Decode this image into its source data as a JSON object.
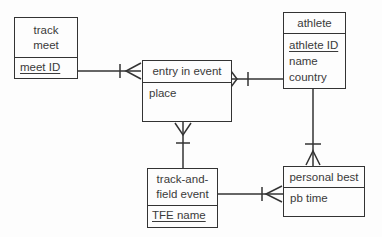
{
  "diagram": {
    "kind": "entity-relationship-diagram",
    "notation": "crows-foot",
    "colors": {
      "line": "#333333",
      "text": "#3a3a3a",
      "background": "#fdfdfd"
    },
    "entities": [
      {
        "id": "track-meet",
        "name": "track meet",
        "attributes": [
          {
            "label": "meet ID",
            "underlined": true
          }
        ]
      },
      {
        "id": "entry-in-event",
        "name": "entry in event",
        "attributes": [
          {
            "label": "place",
            "underlined": false
          }
        ]
      },
      {
        "id": "athlete",
        "name": "athlete",
        "attributes": [
          {
            "label": "athlete ID",
            "underlined": true
          },
          {
            "label": "name",
            "underlined": false
          },
          {
            "label": "country",
            "underlined": false
          }
        ]
      },
      {
        "id": "track-and-field-event",
        "name": "track-and-field event",
        "attributes": [
          {
            "label": "TFE name",
            "underlined": true
          }
        ]
      },
      {
        "id": "personal-best",
        "name": "personal best",
        "attributes": [
          {
            "label": "pb time",
            "underlined": false
          }
        ]
      }
    ],
    "relationships": [
      {
        "from": "track meet",
        "to": "entry in event",
        "from_cardinality": "one",
        "to_cardinality": "many"
      },
      {
        "from": "athlete",
        "to": "entry in event",
        "from_cardinality": "one",
        "to_cardinality": "many"
      },
      {
        "from": "track-and-field event",
        "to": "entry in event",
        "from_cardinality": "one",
        "to_cardinality": "many"
      },
      {
        "from": "athlete",
        "to": "personal best",
        "from_cardinality": "one",
        "to_cardinality": "many"
      },
      {
        "from": "track-and-field event",
        "to": "personal best",
        "from_cardinality": "one",
        "to_cardinality": "many"
      }
    ]
  }
}
